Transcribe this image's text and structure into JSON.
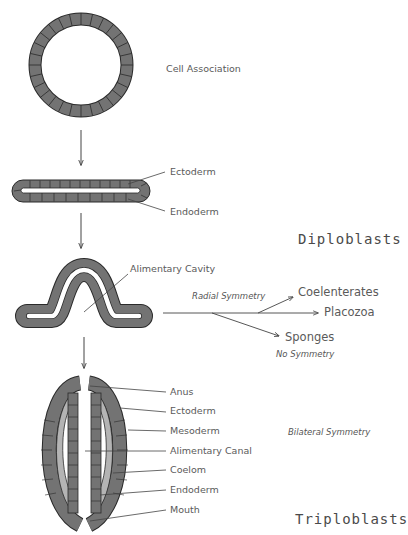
{
  "diagram": {
    "stages": [
      {
        "id": "cell-association",
        "label": "Cell Association"
      },
      {
        "id": "diploblast-flat",
        "labels": [
          "Ectoderm",
          "Endoderm"
        ]
      },
      {
        "id": "diploblast-folded",
        "labels": [
          "Alimentary Cavity"
        ]
      },
      {
        "id": "triploblast",
        "labels": [
          "Anus",
          "Ectoderm",
          "Mesoderm",
          "Alimentary Canal",
          "Coelom",
          "Endoderm",
          "Mouth"
        ]
      }
    ],
    "groups": {
      "diploblasts": "Diploblasts",
      "triploblasts": "Triploblasts"
    },
    "branches": {
      "radial_symmetry": "Radial Symmetry",
      "coelenterates": "Coelenterates",
      "placozoa": "Placozoa",
      "sponges": "Sponges",
      "no_symmetry": "No Symmetry",
      "bilateral_symmetry": "Bilateral Symmetry"
    },
    "colors": {
      "cell_fill": "#707070",
      "cell_stroke": "#2a2a2a",
      "mesoderm_fill": "#b4b4b4",
      "line": "#444444",
      "text": "#5a5a5a"
    }
  }
}
